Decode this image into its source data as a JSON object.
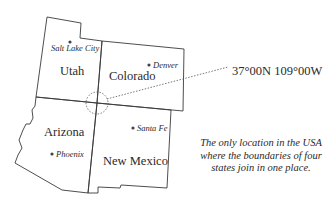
{
  "map": {
    "states": [
      {
        "name": "Utah"
      },
      {
        "name": "Colorado"
      },
      {
        "name": "Arizona"
      },
      {
        "name": "New Mexico"
      }
    ],
    "cities": [
      {
        "name": "Salt Lake City",
        "state": "Utah"
      },
      {
        "name": "Denver",
        "state": "Colorado"
      },
      {
        "name": "Phoenix",
        "state": "Arizona"
      },
      {
        "name": "Santa Fe",
        "state": "New Mexico"
      }
    ],
    "four_corners_coordinates": "37°00N 109°00W",
    "caption": "The only location in the USA where the boundaries of four states join in one place.",
    "colors": {
      "line": "#3a3a3a",
      "background": "#ffffff",
      "text": "#2a2a2a"
    }
  }
}
